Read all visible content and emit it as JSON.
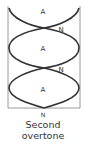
{
  "diagram": {
    "title": "Second overtone",
    "caption_lines": [
      "Second",
      "overtone"
    ],
    "antinode_label": "A",
    "node_label": "N",
    "labels": {
      "antinode_top": "A",
      "node_1": "N",
      "antinode_middle": "A",
      "node_2": "N",
      "antinode_bottom": "A",
      "node_bottom": "N"
    },
    "colors": {
      "tube": "#9a9a9a",
      "wave": "#333333",
      "text": "#333333"
    }
  }
}
